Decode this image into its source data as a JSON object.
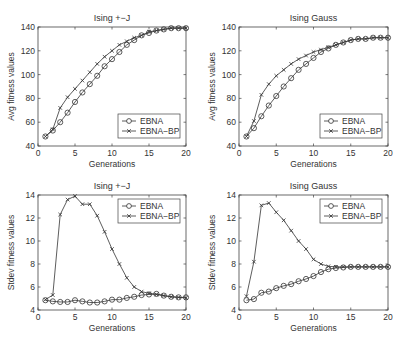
{
  "chart_data": [
    {
      "type": "line",
      "title": "Ising +−J",
      "xlabel": "Generations",
      "ylabel": "Avg fitness values",
      "xlim": [
        0,
        20
      ],
      "ylim": [
        40,
        140
      ],
      "xticks": [
        0,
        5,
        10,
        15,
        20
      ],
      "yticks": [
        40,
        60,
        80,
        100,
        120,
        140
      ],
      "grid": false,
      "legend_position": "lower right",
      "x": [
        1,
        2,
        3,
        4,
        5,
        6,
        7,
        8,
        9,
        10,
        11,
        12,
        13,
        14,
        15,
        16,
        17,
        18,
        19,
        20
      ],
      "series": [
        {
          "name": "EBNA",
          "marker": "circle",
          "values": [
            48,
            53,
            60,
            68,
            77,
            85,
            92,
            99,
            107,
            113,
            119,
            125,
            129,
            133,
            135,
            137,
            138,
            139,
            139,
            139
          ]
        },
        {
          "name": "EBNA−BP",
          "marker": "x",
          "values": [
            48,
            54,
            72,
            81,
            88,
            95,
            102,
            109,
            115,
            120,
            125,
            128,
            131,
            133,
            136,
            137,
            138,
            139,
            139,
            139
          ]
        }
      ]
    },
    {
      "type": "line",
      "title": "Ising Gauss",
      "xlabel": "Generations",
      "ylabel": "Avg fitness values",
      "xlim": [
        0,
        20
      ],
      "ylim": [
        40,
        140
      ],
      "xticks": [
        0,
        5,
        10,
        15,
        20
      ],
      "yticks": [
        40,
        60,
        80,
        100,
        120,
        140
      ],
      "grid": false,
      "legend_position": "lower right",
      "x": [
        1,
        2,
        3,
        4,
        5,
        6,
        7,
        8,
        9,
        10,
        11,
        12,
        13,
        14,
        15,
        16,
        17,
        18,
        19,
        20
      ],
      "series": [
        {
          "name": "EBNA",
          "marker": "circle",
          "values": [
            48,
            55,
            65,
            74,
            82,
            90,
            97,
            104,
            109,
            114,
            119,
            122,
            125,
            127,
            129,
            130,
            130,
            131,
            131,
            131
          ]
        },
        {
          "name": "EBNA−BP",
          "marker": "x",
          "values": [
            48,
            61,
            83,
            92,
            99,
            104,
            109,
            113,
            116,
            119,
            121,
            123,
            125,
            127,
            129,
            130,
            130,
            131,
            131,
            131
          ]
        }
      ]
    },
    {
      "type": "line",
      "title": "Ising +−J",
      "xlabel": "Generations",
      "ylabel": "Stdev fitness values",
      "xlim": [
        0,
        20
      ],
      "ylim": [
        4,
        14
      ],
      "xticks": [
        0,
        5,
        10,
        15,
        20
      ],
      "yticks": [
        4,
        6,
        8,
        10,
        12,
        14
      ],
      "grid": false,
      "legend_position": "upper right",
      "x": [
        1,
        2,
        3,
        4,
        5,
        6,
        7,
        8,
        9,
        10,
        11,
        12,
        13,
        14,
        15,
        16,
        17,
        18,
        19,
        20
      ],
      "series": [
        {
          "name": "EBNA",
          "marker": "circle",
          "values": [
            4.85,
            4.75,
            4.7,
            4.7,
            4.85,
            4.75,
            4.65,
            4.65,
            4.75,
            4.9,
            4.9,
            5.05,
            5.15,
            5.3,
            5.35,
            5.4,
            5.25,
            5.15,
            5.1,
            5.1
          ]
        },
        {
          "name": "EBNA−BP",
          "marker": "x",
          "values": [
            4.9,
            5.3,
            12.3,
            13.6,
            13.9,
            13.2,
            13.2,
            12.2,
            10.8,
            9.3,
            8.0,
            6.8,
            6.0,
            5.6,
            5.45,
            5.35,
            5.25,
            5.15,
            5.1,
            5.05
          ]
        }
      ]
    },
    {
      "type": "line",
      "title": "Ising Gauss",
      "xlabel": "Generations",
      "ylabel": "Stdev fitness values",
      "xlim": [
        0,
        20
      ],
      "ylim": [
        4,
        14
      ],
      "xticks": [
        0,
        5,
        10,
        15,
        20
      ],
      "yticks": [
        4,
        6,
        8,
        10,
        12,
        14
      ],
      "grid": false,
      "legend_position": "upper right",
      "x": [
        1,
        2,
        3,
        4,
        5,
        6,
        7,
        8,
        9,
        10,
        11,
        12,
        13,
        14,
        15,
        16,
        17,
        18,
        19,
        20
      ],
      "series": [
        {
          "name": "EBNA",
          "marker": "circle",
          "values": [
            4.85,
            4.95,
            5.5,
            5.6,
            5.9,
            6.1,
            6.25,
            6.5,
            6.7,
            6.95,
            7.3,
            7.55,
            7.65,
            7.7,
            7.75,
            7.75,
            7.75,
            7.75,
            7.75,
            7.75
          ]
        },
        {
          "name": "EBNA−BP",
          "marker": "x",
          "values": [
            5.2,
            8.2,
            13.1,
            13.3,
            12.5,
            11.8,
            10.9,
            10.0,
            9.3,
            8.4,
            8.0,
            7.8,
            7.75,
            7.75,
            7.75,
            7.75,
            7.75,
            7.75,
            7.75,
            7.75
          ]
        }
      ]
    }
  ],
  "colors": {
    "line": "#333333",
    "axis": "#444444",
    "background": "#ffffff"
  }
}
